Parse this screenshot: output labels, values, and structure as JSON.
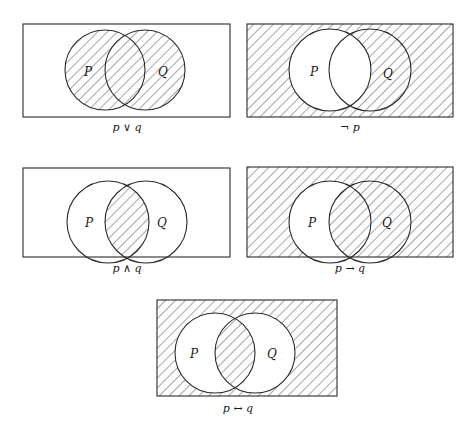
{
  "figure": {
    "colors": {
      "stroke": "#2a2a2a",
      "hatch": "#3a3a3a",
      "background": "#ffffff"
    },
    "set_labels": {
      "p": "P",
      "q": "Q"
    },
    "diagrams": [
      {
        "id": "disjunction",
        "caption": "p ∨ q",
        "shaded_regions": [
          "P only",
          "P and Q",
          "Q only"
        ],
        "frame": {
          "x": 23,
          "y": 24,
          "w": 207,
          "h": 93
        },
        "circle_p": {
          "cx": 105,
          "cy": 70,
          "r": 40
        },
        "circle_q": {
          "cx": 145,
          "cy": 70,
          "r": 40
        },
        "caption_pos": {
          "x": 127,
          "y": 131
        }
      },
      {
        "id": "negation",
        "caption": "¬ p",
        "shaded_regions": [
          "outside P and Q",
          "Q only"
        ],
        "frame": {
          "x": 247,
          "y": 24,
          "w": 206,
          "h": 93
        },
        "circle_p": {
          "cx": 330,
          "cy": 70,
          "r": 41
        },
        "circle_q": {
          "cx": 370,
          "cy": 70,
          "r": 41
        },
        "caption_pos": {
          "x": 350,
          "y": 131
        }
      },
      {
        "id": "conjunction",
        "caption": "p ∧ q",
        "shaded_regions": [
          "P and Q"
        ],
        "frame": {
          "x": 23,
          "y": 168,
          "w": 207,
          "h": 89
        },
        "circle_p": {
          "cx": 108,
          "cy": 222,
          "r": 41
        },
        "circle_q": {
          "cx": 146,
          "cy": 222,
          "r": 41
        },
        "caption_pos": {
          "x": 127,
          "y": 272
        }
      },
      {
        "id": "conditional",
        "caption": "p → q",
        "shaded_regions": [
          "outside P and Q",
          "P and Q",
          "Q only"
        ],
        "frame": {
          "x": 247,
          "y": 167,
          "w": 206,
          "h": 90
        },
        "circle_p": {
          "cx": 330,
          "cy": 222,
          "r": 41
        },
        "circle_q": {
          "cx": 370,
          "cy": 222,
          "r": 41
        },
        "caption_pos": {
          "x": 350,
          "y": 272
        }
      },
      {
        "id": "biconditional",
        "caption": "p ↔ q",
        "shaded_regions": [
          "outside P and Q",
          "P and Q"
        ],
        "frame": {
          "x": 157,
          "y": 300,
          "w": 180,
          "h": 96
        },
        "circle_p": {
          "cx": 215,
          "cy": 353,
          "r": 40
        },
        "circle_q": {
          "cx": 255,
          "cy": 353,
          "r": 40
        },
        "caption_pos": {
          "x": 238,
          "y": 412
        }
      }
    ]
  }
}
